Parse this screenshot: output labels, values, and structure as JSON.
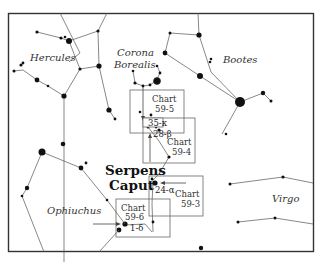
{
  "figure": {
    "constellations": [
      {
        "name": "Hercules",
        "x": 30,
        "y": 61
      },
      {
        "name": "Corona",
        "x": 117,
        "y": 56
      },
      {
        "name": "Borealis",
        "x": 114,
        "y": 68
      },
      {
        "name": "Bootes",
        "x": 223,
        "y": 63
      },
      {
        "name": "Ophiuchus",
        "x": 47,
        "y": 214
      },
      {
        "name": "Virgo",
        "x": 272,
        "y": 202
      }
    ],
    "highlight_label": {
      "line1": "Serpens",
      "line2": "Caput"
    },
    "finder_charts": [
      {
        "id": "chart-59-5",
        "line1": "Chart",
        "line2": "59-5"
      },
      {
        "id": "chart-59-4",
        "line1": "Chart",
        "line2": "59-4"
      },
      {
        "id": "chart-59-3",
        "line1": "Chart",
        "line2": "59-3"
      },
      {
        "id": "chart-59-6",
        "line1": "Chart",
        "line2": "59-6"
      }
    ],
    "star_labels": [
      {
        "label": "35-κ"
      },
      {
        "label": "28-β"
      },
      {
        "label": "24-α"
      },
      {
        "label": "1-δ"
      }
    ]
  }
}
